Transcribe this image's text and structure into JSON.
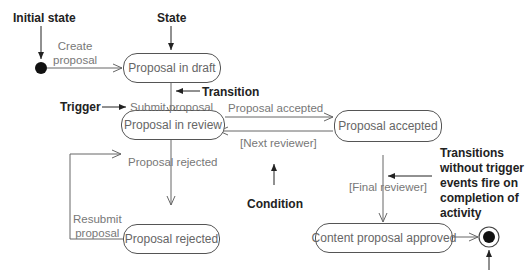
{
  "states": {
    "draft": "Proposal in draft",
    "review": "Proposal in review",
    "accepted": "Proposal accepted",
    "rejected": "Proposal rejected",
    "approved": "Content proposal approved"
  },
  "transitions": {
    "create": "Create\nproposal",
    "submit": "Submit proposal",
    "accepted": "Proposal accepted",
    "next_reviewer": "[Next reviewer]",
    "rejected": "Proposal rejected",
    "resubmit": "Resubmit\nproposal",
    "final_reviewer": "[Final reviewer]"
  },
  "annotations": {
    "initial_state": "Initial state",
    "state": "State",
    "transition": "Transition",
    "trigger": "Trigger",
    "condition": "Condition",
    "no_trigger": "Transitions\nwithout trigger\nevents fire on\ncompletion of\nactivity"
  }
}
